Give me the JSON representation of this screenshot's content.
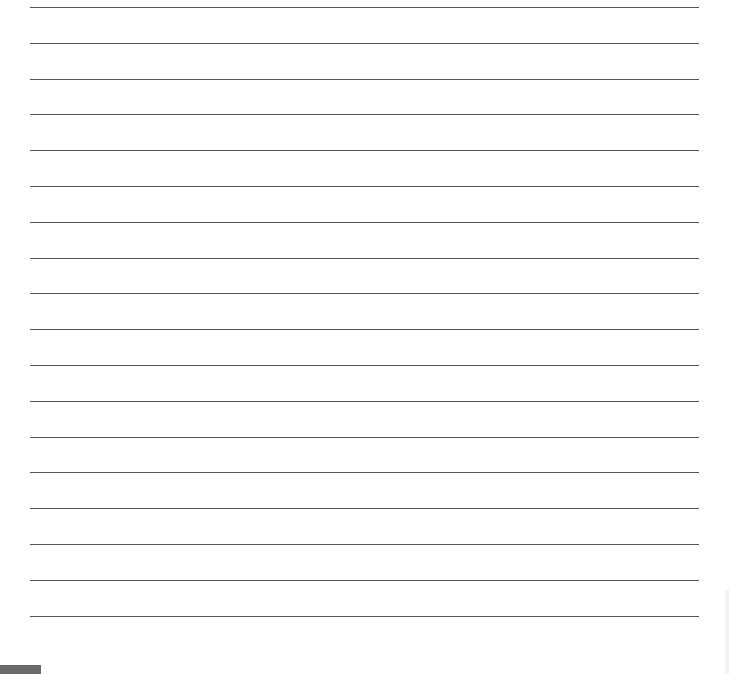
{
  "page": {
    "type": "lined-paper",
    "line_count": 18,
    "line_start_y": 7,
    "line_spacing": 35.8,
    "line_color": "#555555",
    "background": "#ffffff"
  }
}
